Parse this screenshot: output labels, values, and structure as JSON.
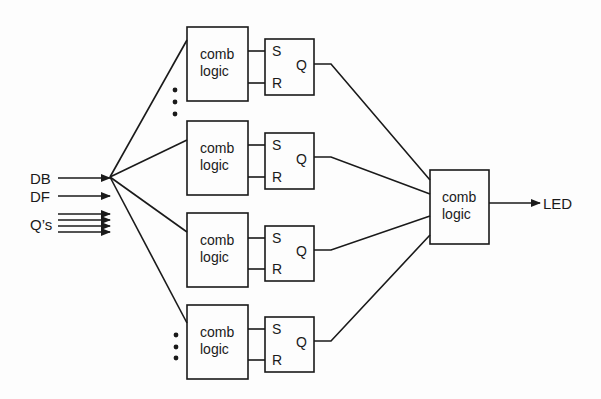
{
  "diagram": {
    "inputs": [
      {
        "label": "DB",
        "y": 178
      },
      {
        "label": "DF",
        "y": 195
      },
      {
        "label": "Q’s",
        "y": 225
      }
    ],
    "comb_blocks": [
      {
        "line1": "comb",
        "line2": "logic",
        "x": 187,
        "y": 27,
        "w": 61,
        "h": 74
      },
      {
        "line1": "comb",
        "line2": "logic",
        "x": 187,
        "y": 121,
        "w": 61,
        "h": 74
      },
      {
        "line1": "comb",
        "line2": "logic",
        "x": 187,
        "y": 213,
        "w": 61,
        "h": 74
      },
      {
        "line1": "comb",
        "line2": "logic",
        "x": 187,
        "y": 305,
        "w": 61,
        "h": 74
      }
    ],
    "sr_latches": [
      {
        "s": "S",
        "r": "R",
        "q": "Q",
        "x": 265,
        "y": 39,
        "w": 49,
        "h": 56
      },
      {
        "s": "S",
        "r": "R",
        "q": "Q",
        "x": 265,
        "y": 133,
        "w": 49,
        "h": 56
      },
      {
        "s": "S",
        "r": "R",
        "q": "Q",
        "x": 265,
        "y": 226,
        "w": 49,
        "h": 55
      },
      {
        "s": "S",
        "r": "R",
        "q": "Q",
        "x": 265,
        "y": 317,
        "w": 49,
        "h": 55
      }
    ],
    "output_block": {
      "line1": "comb",
      "line2": "logic",
      "x": 430,
      "y": 170,
      "w": 59,
      "h": 74
    },
    "output": {
      "label": "LED"
    },
    "ellipsis_groups": [
      {
        "x": 175,
        "ys": [
          90,
          102,
          114
        ]
      },
      {
        "x": 176,
        "ys": [
          335,
          347,
          358
        ]
      }
    ],
    "colors": {
      "line": "#1a1a1a",
      "background": "#fdfdfd"
    }
  }
}
